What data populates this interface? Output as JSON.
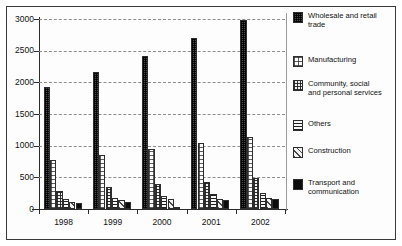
{
  "chart_data": {
    "type": "bar",
    "title": "",
    "subtitle": "",
    "xlabel": "",
    "ylabel": "",
    "categories": [
      "1998",
      "1999",
      "2000",
      "2001",
      "2002"
    ],
    "ylim": [
      0,
      3000
    ],
    "yticks": [
      0,
      500,
      1000,
      1500,
      2000,
      2500,
      3000
    ],
    "ytick_labels": [
      "0",
      "500",
      "1000",
      "1500",
      "2000",
      "2500",
      "3000"
    ],
    "grid": true,
    "grid_style": "dashed-horizontal",
    "legend_position": "right",
    "orientation": "vertical",
    "series": [
      {
        "name": "Wholesale and retail trade",
        "pattern": "dark-checker",
        "color": "#4a4a4a",
        "values": [
          1930,
          2160,
          2420,
          2700,
          2990
        ]
      },
      {
        "name": "Manufacturing",
        "pattern": "light-dotted",
        "color": "#fbfbfb",
        "values": [
          780,
          860,
          940,
          1040,
          1140
        ]
      },
      {
        "name": "Community, social and personal services",
        "pattern": "grid-mesh",
        "color": "#efefef",
        "values": [
          290,
          340,
          390,
          430,
          490
        ]
      },
      {
        "name": "Others",
        "pattern": "horizontal-stripes",
        "color": "#f7f7f7",
        "values": [
          165,
          175,
          205,
          235,
          255
        ]
      },
      {
        "name": "Construction",
        "pattern": "diagonal-hatch",
        "color": "#f2f2f2",
        "values": [
          110,
          140,
          155,
          160,
          175
        ]
      },
      {
        "name": "Transport and communication",
        "pattern": "solid-black",
        "color": "#0b0b0b",
        "values": [
          95,
          110,
          15,
          140,
          165
        ]
      }
    ]
  },
  "legend": {
    "items": [
      {
        "label": "Wholesale and retail\ntrade",
        "pattern": "dark-checker"
      },
      {
        "label": "Manufacturing",
        "pattern": "light-dotted"
      },
      {
        "label": "Community, social\nand personal services",
        "pattern": "grid-mesh"
      },
      {
        "label": "Others",
        "pattern": "horizontal-stripes"
      },
      {
        "label": "Construction",
        "pattern": "diagonal-hatch"
      },
      {
        "label": "Transport and\ncommunication",
        "pattern": "solid-black"
      }
    ]
  }
}
